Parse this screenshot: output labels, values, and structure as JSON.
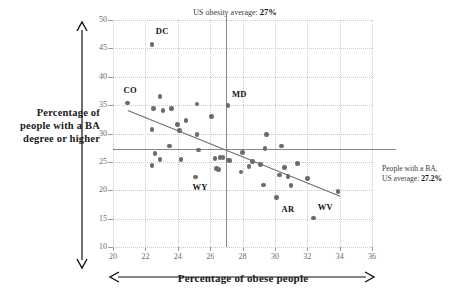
{
  "chart_data": {
    "type": "scatter",
    "title": "",
    "xlabel": "Percentage of obese people",
    "ylabel": "Percentage of people with a BA degree or higher",
    "xlim": [
      20,
      36
    ],
    "ylim": [
      10,
      50
    ],
    "xticks": [
      20,
      22,
      24,
      26,
      28,
      30,
      32,
      34,
      36
    ],
    "yticks": [
      50,
      45,
      40,
      35,
      30,
      25,
      20,
      15,
      10
    ],
    "grid": true,
    "legend": "none",
    "dot_color": "#6b6b6b",
    "line_color": "#8a8a8a",
    "annotations": {
      "vline_label_prefix": "US obesity average: ",
      "vline_label_value": "27%",
      "vline_x": 27,
      "hline_label_line1": "People with a BA,",
      "hline_label_prefix": "US average: ",
      "hline_label_value": "27.2%",
      "hline_y": 27.2
    },
    "trendline": {
      "x0": 20.9,
      "y0": 34.2,
      "x1": 34.0,
      "y1": 19.1
    },
    "points": [
      {
        "x": 20.9,
        "y": 35.4,
        "label": "CO"
      },
      {
        "x": 22.4,
        "y": 45.7,
        "label": "DC"
      },
      {
        "x": 22.4,
        "y": 30.7,
        "label": ""
      },
      {
        "x": 22.4,
        "y": 24.4,
        "label": ""
      },
      {
        "x": 22.5,
        "y": 34.4,
        "label": ""
      },
      {
        "x": 22.6,
        "y": 26.5,
        "label": ""
      },
      {
        "x": 22.9,
        "y": 36.5,
        "label": ""
      },
      {
        "x": 22.9,
        "y": 25.4,
        "label": ""
      },
      {
        "x": 23.1,
        "y": 34.1,
        "label": ""
      },
      {
        "x": 23.6,
        "y": 34.4,
        "label": ""
      },
      {
        "x": 23.5,
        "y": 27.8,
        "label": ""
      },
      {
        "x": 24.0,
        "y": 31.6,
        "label": ""
      },
      {
        "x": 24.1,
        "y": 30.5,
        "label": ""
      },
      {
        "x": 24.2,
        "y": 25.4,
        "label": ""
      },
      {
        "x": 24.5,
        "y": 32.3,
        "label": ""
      },
      {
        "x": 25.1,
        "y": 22.3,
        "label": "WY"
      },
      {
        "x": 25.2,
        "y": 35.2,
        "label": ""
      },
      {
        "x": 25.2,
        "y": 29.8,
        "label": ""
      },
      {
        "x": 25.3,
        "y": 27.1,
        "label": ""
      },
      {
        "x": 26.1,
        "y": 33.0,
        "label": ""
      },
      {
        "x": 26.3,
        "y": 25.6,
        "label": ""
      },
      {
        "x": 26.4,
        "y": 23.8,
        "label": ""
      },
      {
        "x": 26.5,
        "y": 23.7,
        "label": ""
      },
      {
        "x": 26.6,
        "y": 25.8,
        "label": ""
      },
      {
        "x": 26.8,
        "y": 25.8,
        "label": ""
      },
      {
        "x": 27.1,
        "y": 34.9,
        "label": "MD"
      },
      {
        "x": 27.1,
        "y": 25.3,
        "label": ""
      },
      {
        "x": 27.2,
        "y": 25.2,
        "label": ""
      },
      {
        "x": 27.9,
        "y": 23.2,
        "label": ""
      },
      {
        "x": 28.0,
        "y": 26.6,
        "label": ""
      },
      {
        "x": 28.4,
        "y": 24.2,
        "label": ""
      },
      {
        "x": 28.6,
        "y": 25.1,
        "label": ""
      },
      {
        "x": 29.1,
        "y": 24.5,
        "label": ""
      },
      {
        "x": 29.3,
        "y": 20.9,
        "label": ""
      },
      {
        "x": 29.5,
        "y": 29.8,
        "label": ""
      },
      {
        "x": 29.4,
        "y": 27.4,
        "label": ""
      },
      {
        "x": 30.1,
        "y": 18.7,
        "label": "AR"
      },
      {
        "x": 30.3,
        "y": 22.7,
        "label": ""
      },
      {
        "x": 30.4,
        "y": 27.8,
        "label": ""
      },
      {
        "x": 30.6,
        "y": 24.0,
        "label": ""
      },
      {
        "x": 30.8,
        "y": 22.4,
        "label": ""
      },
      {
        "x": 31.0,
        "y": 20.8,
        "label": ""
      },
      {
        "x": 31.4,
        "y": 24.7,
        "label": ""
      },
      {
        "x": 32.0,
        "y": 22.1,
        "label": ""
      },
      {
        "x": 32.4,
        "y": 15.1,
        "label": "WV"
      },
      {
        "x": 33.9,
        "y": 19.8,
        "label": ""
      }
    ],
    "point_labels": [
      {
        "text": "CO",
        "x": 20.9,
        "y": 35.4,
        "dx": -4,
        "dy": -13
      },
      {
        "text": "DC",
        "x": 22.4,
        "y": 45.7,
        "dx": 4,
        "dy": -13
      },
      {
        "text": "MD",
        "x": 27.1,
        "y": 34.9,
        "dx": 4,
        "dy": -12
      },
      {
        "text": "WY",
        "x": 25.1,
        "y": 22.3,
        "dx": -3,
        "dy": 10
      },
      {
        "text": "AR",
        "x": 30.1,
        "y": 18.7,
        "dx": 5,
        "dy": 11
      },
      {
        "text": "WV",
        "x": 32.4,
        "y": 15.1,
        "dx": 4,
        "dy": -11
      }
    ]
  }
}
